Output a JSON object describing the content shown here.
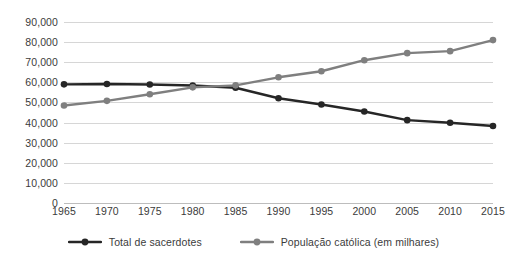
{
  "chart_data": {
    "type": "line",
    "title": "",
    "subtitle": "",
    "xlabel": "",
    "ylabel": "",
    "x": [
      1965,
      1970,
      1975,
      1980,
      1985,
      1990,
      1995,
      2000,
      2005,
      2010,
      2015
    ],
    "xtick_labels": [
      "1965",
      "1970",
      "1975",
      "1980",
      "1985",
      "1990",
      "1995",
      "2000",
      "2005",
      "2010",
      "2015"
    ],
    "ytick_labels": [
      "0",
      "10,000",
      "20,000",
      "30,000",
      "40,000",
      "50,000",
      "60,000",
      "70,000",
      "80,000",
      "90,000"
    ],
    "ytick_values": [
      0,
      10000,
      20000,
      30000,
      40000,
      50000,
      60000,
      70000,
      80000,
      90000
    ],
    "ylim": [
      0,
      90000
    ],
    "xlim": [
      1965,
      2015
    ],
    "grid": true,
    "legend_position": "bottom-center",
    "markers": true,
    "series": [
      {
        "name": "Total de sacerdotes",
        "color": "#262626",
        "values": [
          59000,
          59200,
          58900,
          58400,
          57300,
          52100,
          49000,
          45500,
          41200,
          39900,
          38300
        ]
      },
      {
        "name": "População católica (em milhares)",
        "color": "#7f7f7f",
        "values": [
          48500,
          50800,
          54100,
          57500,
          58500,
          62500,
          65500,
          71000,
          74500,
          75500,
          81000
        ]
      }
    ]
  },
  "legend": {
    "entries": [
      {
        "label": "Total de sacerdotes",
        "color": "#262626"
      },
      {
        "label": "População católica (em milhares)",
        "color": "#7f7f7f"
      }
    ]
  },
  "colors": {
    "series_dark": "#262626",
    "series_gray": "#7f7f7f",
    "gridline": "#d6d6d6",
    "axis": "#bdbdbd",
    "text": "#3b3b3b",
    "background": "#ffffff"
  }
}
